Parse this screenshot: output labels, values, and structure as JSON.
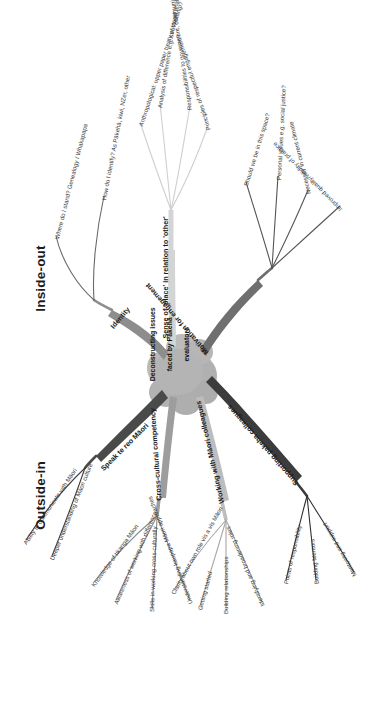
{
  "diagram": {
    "type": "mind-map",
    "orientation": "rotated-90",
    "hub": {
      "title_line1": "Deconstructing issues",
      "title_line2": "faced by Pākehā",
      "title_line3": "evaluators",
      "fill": "#b4b4b4"
    },
    "regions": [
      {
        "id": "inside-out",
        "label": "Inside-out"
      },
      {
        "id": "outside-in",
        "label": "Outside-in"
      }
    ],
    "branches": [
      {
        "id": "identity",
        "label": "Identity",
        "color": "#8d8d8d",
        "twigs": [
          {
            "label": "Where do I stand? Genealogy / Whakapapa"
          },
          {
            "label": "How do I identify? As Pākehā, kiwi, NZer, other"
          }
        ]
      },
      {
        "id": "sense-of-place",
        "label": "Sense of 'place' in relation to 'other'",
        "color": "#d4d4d4",
        "twigs": [
          {
            "label": "Anthropological: upper paper treaty of Waitangi?"
          },
          {
            "label": "Analysis of difference e.g. structural analysis, diversity?"
          },
          {
            "label": "Responsibilities to government, community?"
          },
          {
            "label": "Principles of respectful engagement?"
          }
        ]
      },
      {
        "id": "motivation",
        "label": "Motivation for engagement",
        "color": "#6f6f6f",
        "twigs": [
          {
            "label": "Should we be in this space?"
          },
          {
            "label": "Personal values e.g. social justice?"
          },
          {
            "label": "Necessity in current climate"
          },
          {
            "label": "Improved quality/validity of practice"
          }
        ]
      },
      {
        "id": "speak-te-reo",
        "label": "Speak te reo Māori",
        "color": "#4a4a4a",
        "twigs": [
          {
            "label": "Ability to communicate with Māori"
          },
          {
            "label": "Deeper understanding of Māori culture"
          }
        ]
      },
      {
        "id": "cross-cultural",
        "label": "Cross-cultural competency",
        "color": "#9d9d9d",
        "twigs": [
          {
            "label": "Knowledge of tikanga Māori"
          },
          {
            "label": "Awareness of working with difference"
          },
          {
            "label": "Skills in working cross-culturally"
          },
          {
            "label": "Understanding kaupapa Māori approaches"
          }
        ]
      },
      {
        "id": "working-with-maori",
        "label": "Working with Māori colleagues",
        "color": "#bdbdbd",
        "twigs": [
          {
            "label": "Clarity about own role vis a vis Māori"
          },
          {
            "label": "Getting started"
          },
          {
            "label": "Building relationships"
          },
          {
            "label": "Identifying and broadening roles"
          }
        ]
      },
      {
        "id": "supporting-pakeha",
        "label": "Supporting pakeha colleagues",
        "color": "#3c3c3c",
        "twigs": [
          {
            "label": "Points of responsibility"
          },
          {
            "label": "Building Mentors"
          },
          {
            "label": "Mentoring and support"
          }
        ]
      }
    ]
  }
}
